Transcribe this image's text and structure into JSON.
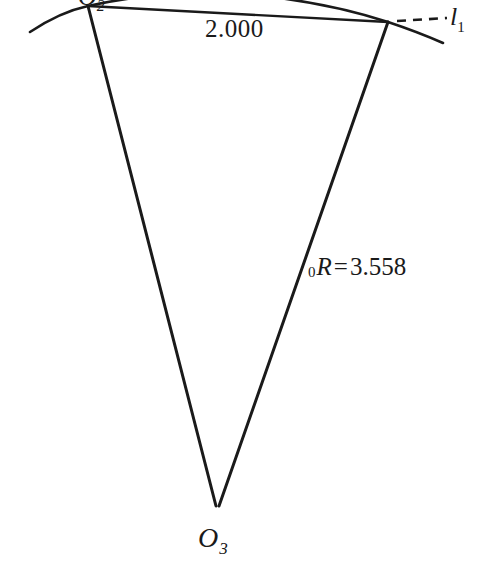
{
  "figure": {
    "type": "geometry-diagram",
    "background_color": "#ffffff",
    "stroke_color": "#1a1a1a",
    "labels": {
      "chord_length": "2.000",
      "radius_value": "3.558",
      "radius_prefix": "0",
      "radius_symbol": "R",
      "radius_equals": "=",
      "apex_vertex": "O",
      "apex_subscript": "3",
      "top_vertex": "O",
      "top_vertex_subscript": "2",
      "tangent_line": "l",
      "tangent_line_subscript": "1"
    },
    "geometry": {
      "top_left_vertex": [
        88,
        6
      ],
      "top_right_vertex": [
        388,
        22
      ],
      "apex_vertex": [
        217,
        507
      ],
      "arc_left_end": [
        30,
        32
      ],
      "arc_right_end": [
        443,
        43
      ],
      "dashed_segment": [
        [
          396,
          21
        ],
        [
          446,
          18
        ]
      ],
      "chord": [
        [
          88,
          6
        ],
        [
          388,
          22
        ]
      ]
    }
  }
}
